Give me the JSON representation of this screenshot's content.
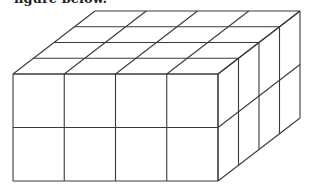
{
  "caption": "figure below.",
  "figure": {
    "length_cubes": 4,
    "depth_cubes": 4,
    "height_cubes": 2,
    "stroke_color": "#3a3a3a",
    "background": "#ffffff"
  }
}
